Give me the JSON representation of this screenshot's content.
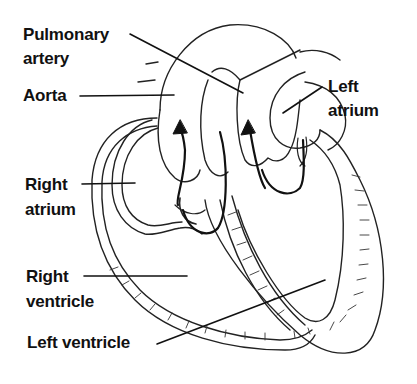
{
  "diagram": {
    "labels": [
      {
        "id": "pulmonary-artery",
        "line1": "Pulmonary",
        "line2": "artery"
      },
      {
        "id": "aorta",
        "line1": "Aorta"
      },
      {
        "id": "left-atrium",
        "line1": "Left",
        "line2": "atrium"
      },
      {
        "id": "right-atrium",
        "line1": "Right",
        "line2": "atrium"
      },
      {
        "id": "right-ventricle",
        "line1": "Right",
        "line2": "ventricle"
      },
      {
        "id": "left-ventricle",
        "line1": "Left ventricle"
      }
    ],
    "colors": {
      "ink": "#111111",
      "background": "#ffffff"
    }
  }
}
